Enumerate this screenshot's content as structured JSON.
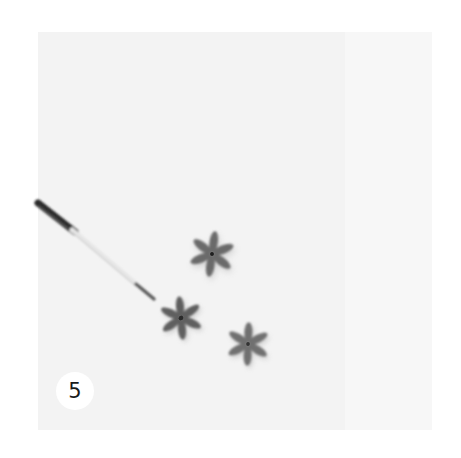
{
  "image": {
    "description": "Photo of three small grey six-petal flowers on a white surface with a fine paintbrush tip pointing at one flower",
    "step_number": "5",
    "colors": {
      "background": "#ffffff",
      "surface": "#f3f3f3",
      "flower": "#6a6a6a",
      "brush_handle": "#2b2b2b",
      "brush_ferrule": "#e8e8e8"
    },
    "objects": [
      {
        "type": "paintbrush",
        "from": [
          38,
          205
        ],
        "to": [
          155,
          298
        ]
      },
      {
        "type": "flower",
        "petals": 6,
        "center": [
          212,
          254
        ]
      },
      {
        "type": "flower",
        "petals": 6,
        "center": [
          181,
          318
        ]
      },
      {
        "type": "flower",
        "petals": 6,
        "center": [
          248,
          344
        ]
      }
    ]
  }
}
